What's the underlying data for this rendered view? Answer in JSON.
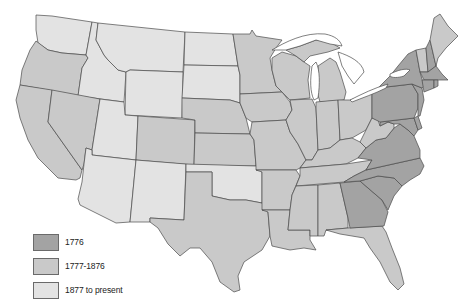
{
  "map": {
    "title": "",
    "colors": {
      "era_1776": "#a3a3a3",
      "era_1777_1876": "#c9c9c9",
      "era_1877_present": "#e3e3e3",
      "border": "#4a4a4a",
      "water": "#ffffff"
    },
    "states": [
      {
        "name": "Washington",
        "era": "1877_present"
      },
      {
        "name": "Oregon",
        "era": "1777_1876"
      },
      {
        "name": "California",
        "era": "1777_1876"
      },
      {
        "name": "Idaho",
        "era": "1877_present"
      },
      {
        "name": "Nevada",
        "era": "1777_1876"
      },
      {
        "name": "Montana",
        "era": "1877_present"
      },
      {
        "name": "Wyoming",
        "era": "1877_present"
      },
      {
        "name": "Utah",
        "era": "1877_present"
      },
      {
        "name": "Arizona",
        "era": "1877_present"
      },
      {
        "name": "Colorado",
        "era": "1777_1876"
      },
      {
        "name": "New Mexico",
        "era": "1877_present"
      },
      {
        "name": "North Dakota",
        "era": "1877_present"
      },
      {
        "name": "South Dakota",
        "era": "1877_present"
      },
      {
        "name": "Nebraska",
        "era": "1777_1876"
      },
      {
        "name": "Kansas",
        "era": "1777_1876"
      },
      {
        "name": "Oklahoma",
        "era": "1877_present"
      },
      {
        "name": "Texas",
        "era": "1777_1876"
      },
      {
        "name": "Minnesota",
        "era": "1777_1876"
      },
      {
        "name": "Iowa",
        "era": "1777_1876"
      },
      {
        "name": "Missouri",
        "era": "1777_1876"
      },
      {
        "name": "Arkansas",
        "era": "1777_1876"
      },
      {
        "name": "Louisiana",
        "era": "1777_1876"
      },
      {
        "name": "Wisconsin",
        "era": "1777_1876"
      },
      {
        "name": "Illinois",
        "era": "1777_1876"
      },
      {
        "name": "Michigan",
        "era": "1777_1876"
      },
      {
        "name": "Indiana",
        "era": "1777_1876"
      },
      {
        "name": "Ohio",
        "era": "1777_1876"
      },
      {
        "name": "Kentucky",
        "era": "1777_1876"
      },
      {
        "name": "Tennessee",
        "era": "1777_1876"
      },
      {
        "name": "Mississippi",
        "era": "1777_1876"
      },
      {
        "name": "Alabama",
        "era": "1777_1876"
      },
      {
        "name": "Florida",
        "era": "1777_1876"
      },
      {
        "name": "Georgia",
        "era": "1776"
      },
      {
        "name": "South Carolina",
        "era": "1776"
      },
      {
        "name": "North Carolina",
        "era": "1776"
      },
      {
        "name": "Virginia",
        "era": "1776"
      },
      {
        "name": "West Virginia",
        "era": "1777_1876"
      },
      {
        "name": "Maryland",
        "era": "1776"
      },
      {
        "name": "Delaware",
        "era": "1776"
      },
      {
        "name": "Pennsylvania",
        "era": "1776"
      },
      {
        "name": "New Jersey",
        "era": "1776"
      },
      {
        "name": "New York",
        "era": "1776"
      },
      {
        "name": "Connecticut",
        "era": "1776"
      },
      {
        "name": "Rhode Island",
        "era": "1776"
      },
      {
        "name": "Massachusetts",
        "era": "1776"
      },
      {
        "name": "Vermont",
        "era": "1777_1876"
      },
      {
        "name": "New Hampshire",
        "era": "1776"
      },
      {
        "name": "Maine",
        "era": "1777_1876"
      }
    ]
  },
  "legend": {
    "items": [
      {
        "label": "1776",
        "color": "#a3a3a3"
      },
      {
        "label": "1777-1876",
        "color": "#c9c9c9"
      },
      {
        "label": "1877 to present",
        "color": "#e3e3e3"
      }
    ]
  }
}
